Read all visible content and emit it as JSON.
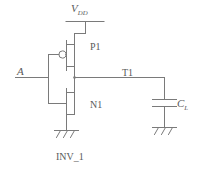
{
  "diagram": {
    "title": "INV_1",
    "type": "cmos-inverter-schematic",
    "line_color": "#7a7a7a",
    "text_color": "#5a5a5a",
    "background": "#ffffff"
  },
  "labels": {
    "supply": {
      "name": "V",
      "subscript": "DD",
      "full": "VDD"
    },
    "input": {
      "name": "A",
      "full": "A"
    },
    "pmos": {
      "name": "P1",
      "full": "P1"
    },
    "nmos": {
      "name": "N1",
      "full": "N1"
    },
    "node": {
      "name": "T1",
      "full": "T1"
    },
    "load_cap": {
      "name": "C",
      "subscript": "L",
      "full": "CL"
    },
    "block": {
      "name": "INV_1",
      "full": "INV_1"
    }
  },
  "components": [
    {
      "id": "vdd-rail",
      "kind": "supply-rail",
      "label": "VDD"
    },
    {
      "id": "p1",
      "kind": "pmos-transistor",
      "label": "P1",
      "gate": "A",
      "drain": "T1",
      "source": "VDD",
      "has_bubble": true
    },
    {
      "id": "n1",
      "kind": "nmos-transistor",
      "label": "N1",
      "gate": "A",
      "drain": "T1",
      "source": "GND",
      "has_bubble": false
    },
    {
      "id": "cl",
      "kind": "capacitor",
      "label": "CL",
      "terminal_a": "T1",
      "terminal_b": "GND"
    },
    {
      "id": "gnd-left",
      "kind": "ground-symbol",
      "label": "GND"
    },
    {
      "id": "gnd-right",
      "kind": "ground-symbol",
      "label": "GND"
    }
  ],
  "nets": [
    {
      "name": "VDD",
      "from": "vdd-rail",
      "to": "p1.source"
    },
    {
      "name": "A",
      "from": "input-terminal",
      "to": [
        "p1.gate",
        "n1.gate"
      ]
    },
    {
      "name": "T1",
      "from": "p1.drain",
      "to": [
        "n1.drain",
        "cl.terminal_a"
      ]
    },
    {
      "name": "GND",
      "from": "n1.source",
      "to": "gnd-left"
    }
  ]
}
